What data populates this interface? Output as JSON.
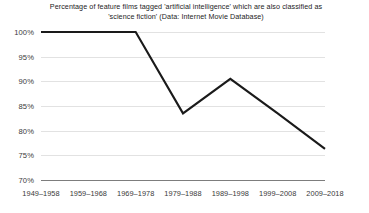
{
  "chart_data": {
    "type": "line",
    "title": "Percentage of feature films tagged 'artificial intelligence' which are also classified as 'science fiction' (Data: Internet Movie Database)",
    "title_lines": [
      "Percentage of feature films tagged 'artificial intelligence' which are also classified as",
      "'science fiction' (Data: Internet Movie Database)"
    ],
    "xlabel": "",
    "ylabel": "",
    "categories": [
      "1949–1958",
      "1959–1968",
      "1969–1978",
      "1979–1988",
      "1989–1998",
      "1999–2008",
      "2009–2018"
    ],
    "values": [
      100,
      100,
      100,
      83.5,
      90.5,
      83.5,
      76.3
    ],
    "value_labels": [
      "100%",
      "100%",
      "100%",
      "83.5%",
      "90.5%",
      "83.5%",
      "76.3%"
    ],
    "ylim": [
      70,
      100
    ],
    "yticks": [
      70,
      75,
      80,
      85,
      90,
      95,
      100
    ],
    "ytick_labels": [
      "70%",
      "75%",
      "80%",
      "85%",
      "90%",
      "95%",
      "100%"
    ],
    "grid": true,
    "legend": false,
    "legend_position": "none",
    "series": [
      {
        "name": "percent sci-fi",
        "values": [
          100,
          100,
          100,
          83.5,
          90.5,
          83.5,
          76.3
        ],
        "color": "#1a1a1a",
        "line_width": 2.1,
        "markers": false
      }
    ],
    "colors": {
      "line": "#1a1a1a",
      "grid": "#e2e2e2",
      "axis": "#7d7d7d",
      "text": "#1c1c1c",
      "background": "#ffffff"
    }
  }
}
